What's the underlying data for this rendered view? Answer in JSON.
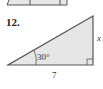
{
  "problem": {
    "number": "12.",
    "angle_label": "30°",
    "base_label": "7",
    "side_label": "x"
  },
  "colors": {
    "fill": "#e6e6e6",
    "stroke": "#555555"
  }
}
